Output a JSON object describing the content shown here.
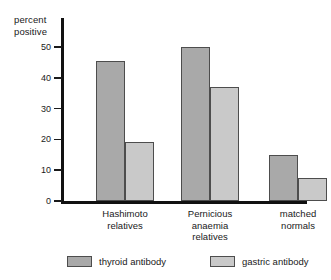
{
  "chart_data": {
    "type": "bar",
    "title": "",
    "xlabel": "",
    "ylabel": "percent\npositive",
    "ylim": [
      0,
      55
    ],
    "yticks": [
      0,
      10,
      20,
      30,
      40,
      50
    ],
    "ytick_labels": [
      "0",
      "10",
      "20",
      "30",
      "40",
      "50"
    ],
    "grid": false,
    "legend_position": "bottom",
    "categories": [
      "Hashimoto\nrelatives",
      "Pernicious\nanaemia\nrelatives",
      "matched\nnormals"
    ],
    "series": [
      {
        "name": "thyroid antibody",
        "color": "#a9a9a9",
        "values": [
          45.5,
          50,
          15
        ]
      },
      {
        "name": "gastric antibody",
        "color": "#c9c9c9",
        "values": [
          19,
          37,
          7.5
        ]
      }
    ]
  },
  "axis": {
    "line_color": "#111111",
    "tick_color": "#1a1a1a"
  }
}
